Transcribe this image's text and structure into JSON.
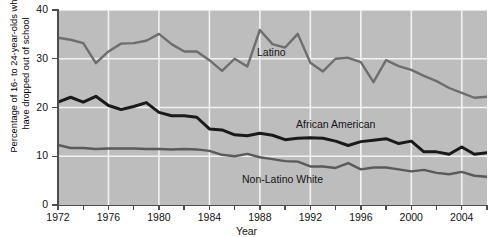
{
  "chart_data": {
    "type": "line",
    "title": "",
    "xlabel": "Year",
    "ylabel": "Percentage of 16- to 24-year-olds who\nhave dropped out of school",
    "xlim": [
      1972,
      2006
    ],
    "ylim": [
      0,
      40
    ],
    "yticks": [
      0,
      10,
      20,
      30,
      40
    ],
    "xticks": [
      1972,
      1974,
      1976,
      1978,
      1980,
      1982,
      1984,
      1986,
      1988,
      1990,
      1992,
      1994,
      1996,
      1998,
      2000,
      2002,
      2004,
      2006
    ],
    "xtick_labels": [
      "1972",
      "",
      "1976",
      "",
      "1980",
      "",
      "1984",
      "",
      "1988",
      "",
      "1992",
      "",
      "1996",
      "",
      "2000",
      "",
      "2004",
      ""
    ],
    "grid": "white gridlines on gray panel, both axes at labeled ticks",
    "legend": "inline annotations on plot",
    "plot_background": "#bdbdbd",
    "gridline_color": "#f2f2f2",
    "x": [
      1972,
      1973,
      1974,
      1975,
      1976,
      1977,
      1978,
      1979,
      1980,
      1981,
      1982,
      1983,
      1984,
      1985,
      1986,
      1987,
      1988,
      1989,
      1990,
      1991,
      1992,
      1993,
      1994,
      1995,
      1996,
      1997,
      1998,
      1999,
      2000,
      2001,
      2002,
      2003,
      2004,
      2005,
      2006
    ],
    "series": [
      {
        "name": "Latino",
        "color": "#6e6e6e",
        "label_position": {
          "x": 1986,
          "y": 34
        },
        "values": [
          34.3,
          33.9,
          33.2,
          29.1,
          31.5,
          33.1,
          33.2,
          33.7,
          35.1,
          33.0,
          31.5,
          31.5,
          29.7,
          27.5,
          30.0,
          28.4,
          35.9,
          33.0,
          32.3,
          35.1,
          29.2,
          27.4,
          30.0,
          30.2,
          29.3,
          25.2,
          29.7,
          28.5,
          27.7,
          26.5,
          25.4,
          24.0,
          23.0,
          22.0,
          22.2
        ]
      },
      {
        "name": "African American",
        "color": "#1a1a1a",
        "label_position": {
          "x": 1990,
          "y": 19
        },
        "values": [
          21.1,
          22.1,
          21.1,
          22.3,
          20.4,
          19.6,
          20.2,
          21.0,
          19.0,
          18.3,
          18.3,
          18.0,
          15.6,
          15.4,
          14.4,
          14.2,
          14.7,
          14.3,
          13.4,
          13.7,
          13.8,
          13.7,
          13.1,
          12.2,
          13.0,
          13.3,
          13.6,
          12.6,
          13.1,
          10.9,
          10.9,
          10.4,
          11.9,
          10.4,
          10.7
        ]
      },
      {
        "name": "Non-Latino White",
        "color": "#5a5a5a",
        "label_position": {
          "x": 1984,
          "y": 8
        },
        "values": [
          12.3,
          11.7,
          11.7,
          11.5,
          11.6,
          11.6,
          11.6,
          11.5,
          11.5,
          11.4,
          11.5,
          11.4,
          11.1,
          10.3,
          10.0,
          10.5,
          9.8,
          9.4,
          9.0,
          8.9,
          7.9,
          7.9,
          7.6,
          8.6,
          7.3,
          7.7,
          7.7,
          7.3,
          6.9,
          7.2,
          6.6,
          6.3,
          6.8,
          6.0,
          5.8
        ]
      }
    ]
  },
  "axis": {
    "ytitle": "Percentage of 16- to 24-year-olds who\nhave dropped out of school",
    "xtitle": "Year"
  },
  "annotations": {
    "latino": "Latino",
    "african_american": "African American",
    "non_latino_white": "Non-Latino White"
  }
}
